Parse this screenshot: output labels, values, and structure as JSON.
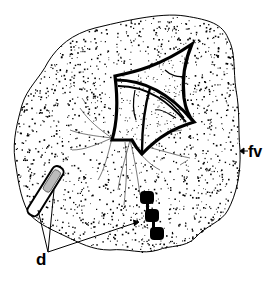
{
  "figure": {
    "ink_color": "#000000",
    "background_color": "#ffffff",
    "labels": [
      {
        "id": "fv",
        "text": "fv",
        "meaning": "food vacuole"
      },
      {
        "id": "d",
        "text": "d",
        "meaning": "debris"
      }
    ],
    "parts": [
      {
        "id": "vacuole",
        "name": "food vacuole (stippled region)"
      },
      {
        "id": "diatom",
        "name": "diatom frustule (kite-shaped)"
      },
      {
        "id": "strands",
        "name": "radiating fine strands"
      },
      {
        "id": "rod-debris",
        "name": "rod-shaped debris particle"
      },
      {
        "id": "bead-chain",
        "name": "chain of three dark debris granules",
        "count": 3
      }
    ]
  }
}
